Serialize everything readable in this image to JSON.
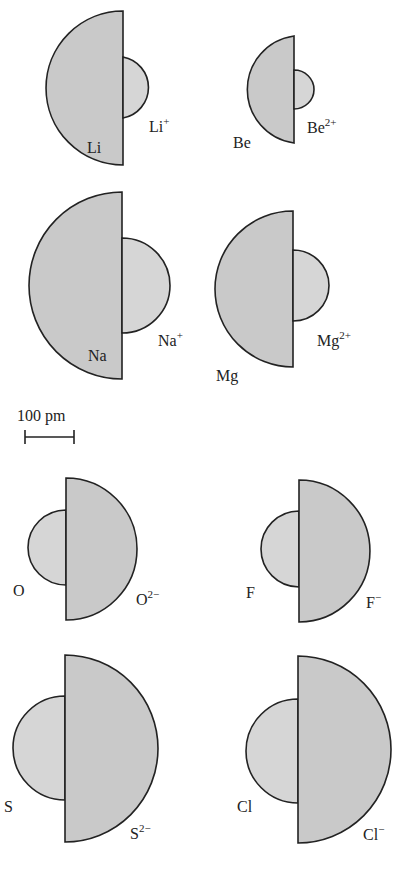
{
  "figure": {
    "scale_bar": {
      "label": "100 pm",
      "length_px": 49
    },
    "pairs": [
      {
        "id": "li",
        "atom": "Li",
        "ion_base": "Li",
        "ion_charge": "+",
        "atom_radius_px": 77,
        "ion_radius_px": 31
      },
      {
        "id": "be",
        "atom": "Be",
        "ion_base": "Be",
        "ion_charge": "2+",
        "atom_radius_px": 54,
        "ion_radius_px": 20
      },
      {
        "id": "na",
        "atom": "Na",
        "ion_base": "Na",
        "ion_charge": "+",
        "atom_radius_px": 93,
        "ion_radius_px": 48
      },
      {
        "id": "mg",
        "atom": "Mg",
        "ion_base": "Mg",
        "ion_charge": "2+",
        "atom_radius_px": 78,
        "ion_radius_px": 36
      },
      {
        "id": "o",
        "atom": "O",
        "ion_base": "O",
        "ion_charge": "2−",
        "atom_radius_px": 38,
        "ion_radius_px": 71
      },
      {
        "id": "f",
        "atom": "F",
        "ion_base": "F",
        "ion_charge": "−",
        "atom_radius_px": 38,
        "ion_radius_px": 71
      },
      {
        "id": "s",
        "atom": "S",
        "ion_base": "S",
        "ion_charge": "2−",
        "atom_radius_px": 52,
        "ion_radius_px": 93
      },
      {
        "id": "cl",
        "atom": "Cl",
        "ion_base": "Cl",
        "ion_charge": "−",
        "atom_radius_px": 52,
        "ion_radius_px": 93
      }
    ]
  },
  "colors": {
    "fill_large": "#c9c9c9",
    "fill_small": "#d6d6d6",
    "stroke": "#222222"
  }
}
